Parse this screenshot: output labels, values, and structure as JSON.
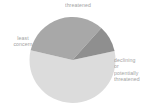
{
  "chart_data": {
    "type": "pie",
    "title": "",
    "subtitle": "",
    "xlabel": "",
    "ylabel": "",
    "grid": false,
    "legend_position": "none",
    "labels_position": "outside",
    "center": [
      72.5,
      60
    ],
    "radius": 43,
    "start_angle_deg": -90,
    "direction": "clockwise",
    "categories": [
      "declining or potentially threatened",
      "least concern",
      "threatened"
    ],
    "values": [
      57,
      33,
      10
    ],
    "units": "percent",
    "colors": [
      "#dcdcdc",
      "#a8a8a8",
      "#8f8f8f"
    ],
    "slices": [
      {
        "name": "declining or potentially threatened",
        "label_lines": [
          "declining",
          "or",
          "potentially",
          "threatened"
        ],
        "value": 57,
        "color": "#dcdcdc",
        "start_deg": -12,
        "end_deg": 193
      },
      {
        "name": "least concern",
        "label_lines": [
          "least",
          "concern"
        ],
        "value": 33,
        "color": "#a8a8a8",
        "start_deg": 193,
        "end_deg": 312
      },
      {
        "name": "threatened",
        "label_lines": [
          "threatened"
        ],
        "value": 10,
        "color": "#8f8f8f",
        "start_deg": 312,
        "end_deg": 348
      }
    ]
  },
  "labels": {
    "threatened": "threatened",
    "least_concern": "least\nconcern",
    "declining": "declining\nor\npotentially\nthreatened"
  },
  "style": {
    "background": "#ffffff",
    "text_color": "#9a9a9a",
    "slice_light": "#dcdcdc",
    "slice_medium": "#a8a8a8",
    "slice_dark": "#8f8f8f"
  }
}
